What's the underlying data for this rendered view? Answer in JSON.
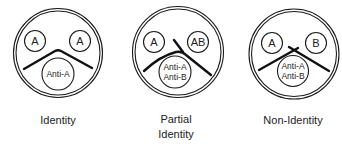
{
  "diagrams": [
    {
      "name": "identity",
      "caption": [
        "Identity"
      ],
      "wells": [
        "A",
        "A"
      ],
      "antibody": [
        "Anti-A"
      ],
      "pattern": "smooth-arc"
    },
    {
      "name": "partial-identity",
      "caption": [
        "Partial",
        "Identity"
      ],
      "wells": [
        "A",
        "AB"
      ],
      "antibody": [
        "Anti-A",
        "Anti-B"
      ],
      "pattern": "spur"
    },
    {
      "name": "non-identity",
      "caption": [
        "Non-Identity"
      ],
      "wells": [
        "A",
        "B"
      ],
      "antibody": [
        "Anti-A",
        "Anti-B"
      ],
      "pattern": "crossed-lines"
    }
  ],
  "colors": {
    "stroke": "#1a1a1a",
    "text": "#222222",
    "background": "#ffffff"
  }
}
